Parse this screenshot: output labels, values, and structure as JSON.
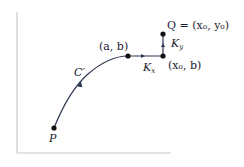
{
  "diagram": {
    "colors": {
      "curve": "#2a3550",
      "point": "#111111",
      "axis": "#c8c8c8",
      "text": "#1a1a2e"
    },
    "points": [
      {
        "id": "P",
        "label": "P",
        "x": 54,
        "y": 128
      },
      {
        "id": "ab",
        "label": "(a, b)",
        "x": 128,
        "y": 56
      },
      {
        "id": "x0b",
        "label": "(x₀, b)",
        "x": 163,
        "y": 56
      },
      {
        "id": "Q",
        "label": "Q = (x₀, y₀)",
        "x": 163,
        "y": 34
      }
    ],
    "curves": [
      {
        "id": "C_prime",
        "label": "C′",
        "from": "P",
        "to": "ab"
      },
      {
        "id": "K_x",
        "label": "K",
        "sub": "x",
        "from": "ab",
        "to": "x0b"
      },
      {
        "id": "K_y",
        "label": "K",
        "sub": "y",
        "from": "x0b",
        "to": "Q"
      }
    ],
    "labels": {
      "P": "P",
      "ab": "(a, b)",
      "x0b": "(x₀, b)",
      "Q": "Q = (x₀, y₀)",
      "C_prime": "C′",
      "Kx": "K",
      "Kx_sub": "x",
      "Ky": "K",
      "Ky_sub": "y"
    }
  }
}
